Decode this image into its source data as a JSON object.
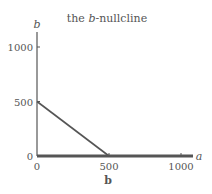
{
  "chart_data": {
    "type": "line",
    "title": "the b-nullcline",
    "title_parts": {
      "prefix": "the ",
      "italic": "b",
      "suffix": "-nullcline"
    },
    "xlabel": "a",
    "ylabel": "b",
    "caption": "b",
    "xlim": [
      0,
      1100
    ],
    "ylim": [
      0,
      1100
    ],
    "x_ticks": [
      0,
      500,
      1000
    ],
    "y_ticks": [
      0,
      500,
      1000
    ],
    "x_tick_labels": [
      "0",
      "500",
      "1000"
    ],
    "y_tick_labels": [
      "0",
      "500",
      "1000"
    ],
    "grid": false,
    "series": [
      {
        "name": "nullcline-diagonal",
        "x": [
          0,
          500
        ],
        "y": [
          500,
          0
        ]
      },
      {
        "name": "nullcline-axis",
        "x": [
          0,
          1080
        ],
        "y": [
          0,
          0
        ]
      }
    ],
    "colors": {
      "axis": "#555555",
      "line": "#555555",
      "text": "#555555"
    }
  }
}
